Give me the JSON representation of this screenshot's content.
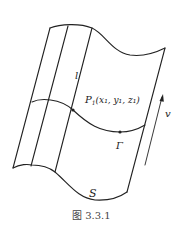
{
  "figure": {
    "caption": "图 3.3.1",
    "labels": {
      "ruling": "l",
      "point": "P",
      "point_subscript": "1",
      "point_coords": "(x₁, y₁, z₁)",
      "curve": "Γ",
      "surface": "S",
      "direction": "v"
    },
    "colors": {
      "line": "#222222",
      "background": "#ffffff"
    }
  }
}
